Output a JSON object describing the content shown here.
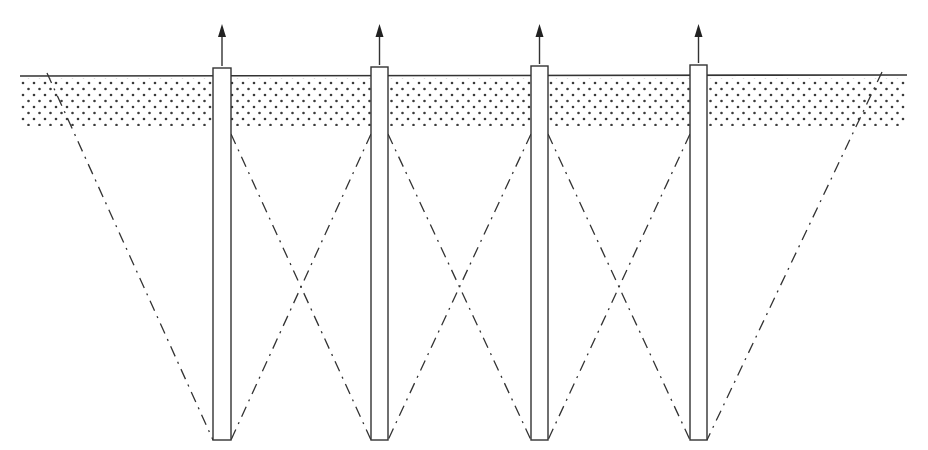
{
  "diagram": {
    "title": "",
    "canvas": {
      "width": 928,
      "height": 450,
      "background": "#ffffff"
    },
    "colors": {
      "ink": "#333333",
      "dot": "#3a3a3a",
      "pile_fill": "#ffffff"
    },
    "surface_band": {
      "x1": 20,
      "x2": 907,
      "top": 76,
      "bottom": 126,
      "pattern": "dots",
      "dot_spacing_x": 11,
      "dot_spacing_y": 6,
      "dot_radius": 1.3
    },
    "piles": [
      {
        "id": "pile-1",
        "x": 213,
        "width": 18,
        "top": 68,
        "bottom": 440,
        "arrow_top": 24
      },
      {
        "id": "pile-2",
        "x": 371,
        "width": 17,
        "top": 67,
        "bottom": 440,
        "arrow_top": 24
      },
      {
        "id": "pile-3",
        "x": 531,
        "width": 17,
        "top": 66,
        "bottom": 440,
        "arrow_top": 24
      },
      {
        "id": "pile-4",
        "x": 690,
        "width": 17,
        "top": 65,
        "bottom": 440,
        "arrow_top": 24
      }
    ],
    "influence_lines": [
      {
        "id": "outer-left",
        "x1": 47,
        "y1": 73,
        "x2": 213,
        "y2": 440,
        "style": "dash-dot"
      },
      {
        "id": "p1-p2-a",
        "x1": 231,
        "y1": 134,
        "x2": 371,
        "y2": 440,
        "style": "dash-dot"
      },
      {
        "id": "p1-p2-b",
        "x1": 371,
        "y1": 134,
        "x2": 231,
        "y2": 440,
        "style": "dash-dot"
      },
      {
        "id": "p2-p3-a",
        "x1": 388,
        "y1": 134,
        "x2": 531,
        "y2": 440,
        "style": "dash-dot"
      },
      {
        "id": "p2-p3-b",
        "x1": 531,
        "y1": 134,
        "x2": 388,
        "y2": 440,
        "style": "dash-dot"
      },
      {
        "id": "p3-p4-a",
        "x1": 548,
        "y1": 134,
        "x2": 690,
        "y2": 440,
        "style": "dash-dot"
      },
      {
        "id": "p3-p4-b",
        "x1": 690,
        "y1": 134,
        "x2": 548,
        "y2": 440,
        "style": "dash-dot"
      },
      {
        "id": "outer-right",
        "x1": 882,
        "y1": 72,
        "x2": 707,
        "y2": 440,
        "style": "dash-dot"
      }
    ],
    "icons": {
      "pull_arrow": "arrow-up-icon"
    }
  }
}
